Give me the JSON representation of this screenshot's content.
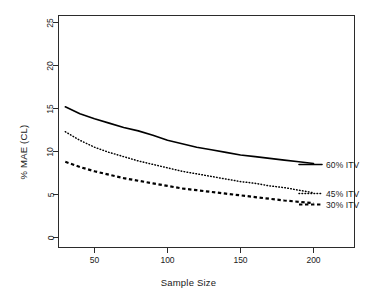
{
  "chart_data": {
    "type": "line",
    "title": "",
    "xlabel": "Sample Size",
    "ylabel": "% MAE (CL)",
    "xlim": [
      30,
      230
    ],
    "ylim": [
      0,
      26
    ],
    "xticks": [
      50,
      100,
      150,
      200
    ],
    "yticks": [
      0,
      5,
      10,
      15,
      20,
      25
    ],
    "grid": false,
    "legend_position": "right-inline",
    "x": [
      30,
      40,
      50,
      60,
      70,
      80,
      90,
      100,
      110,
      120,
      130,
      140,
      150,
      160,
      170,
      180,
      190,
      200
    ],
    "series": [
      {
        "name": "60% ITV",
        "label": "60% ITV",
        "linestyle": "solid",
        "color": "#000000",
        "values": [
          15.2,
          14.4,
          13.8,
          13.3,
          12.8,
          12.4,
          11.9,
          11.3,
          10.9,
          10.5,
          10.2,
          9.9,
          9.6,
          9.4,
          9.2,
          9.0,
          8.8,
          8.6
        ]
      },
      {
        "name": "45% ITV",
        "label": "45% ITV",
        "linestyle": "dotted",
        "color": "#000000",
        "values": [
          12.3,
          11.3,
          10.5,
          9.9,
          9.4,
          8.9,
          8.5,
          8.1,
          7.7,
          7.4,
          7.1,
          6.8,
          6.5,
          6.3,
          6.0,
          5.8,
          5.5,
          5.2
        ]
      },
      {
        "name": "30% ITV",
        "label": "30% ITV",
        "linestyle": "dashed",
        "color": "#000000",
        "values": [
          8.8,
          8.2,
          7.7,
          7.3,
          6.9,
          6.6,
          6.3,
          6.0,
          5.7,
          5.5,
          5.3,
          5.1,
          4.9,
          4.7,
          4.5,
          4.3,
          4.15,
          4.0
        ]
      }
    ]
  },
  "axis": {
    "x_title": "Sample Size",
    "y_title": "% MAE (CL)",
    "x_tick_labels": [
      "50",
      "100",
      "150",
      "200"
    ],
    "y_tick_labels": [
      "0",
      "5",
      "10",
      "15",
      "20",
      "25"
    ]
  },
  "legend": {
    "items": [
      {
        "label": "60% ITV"
      },
      {
        "label": "45% ITV"
      },
      {
        "label": "30% ITV"
      }
    ]
  },
  "colors": {
    "axis": "#2b2b2b",
    "line": "#000000",
    "background": "#ffffff"
  }
}
